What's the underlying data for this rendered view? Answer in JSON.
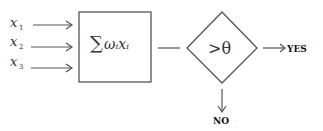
{
  "diagram": {
    "type": "perceptron",
    "inputs": [
      {
        "label": "x",
        "subscript": "1"
      },
      {
        "label": "x",
        "subscript": "2"
      },
      {
        "label": "x",
        "subscript": "3"
      }
    ],
    "summation": {
      "symbol": "∑",
      "text": "ωᵢxᵢ"
    },
    "threshold": {
      "text": ">θ"
    },
    "outputs": {
      "yes": "YES",
      "no": "NO"
    },
    "colors": {
      "stroke": "#555555",
      "text": "#333333",
      "background": "#ffffff"
    }
  }
}
